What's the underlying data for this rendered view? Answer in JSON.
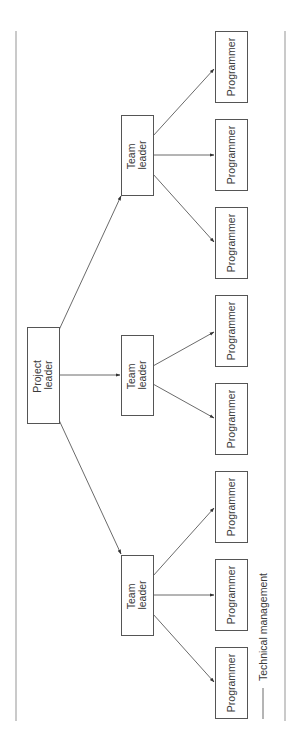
{
  "diagram": {
    "type": "org-chart",
    "orientation": "rotated-90",
    "nodes": {
      "project_leader": {
        "line1": "Project",
        "line2": "leader"
      },
      "team_leaders": [
        {
          "line1": "Team",
          "line2": "leader"
        },
        {
          "line1": "Team",
          "line2": "leader"
        },
        {
          "line1": "Team",
          "line2": "leader"
        }
      ],
      "programmers": [
        {
          "label": "Programmer",
          "team": 1
        },
        {
          "label": "Programmer",
          "team": 1
        },
        {
          "label": "Programmer",
          "team": 1
        },
        {
          "label": "Programmer",
          "team": 2
        },
        {
          "label": "Programmer",
          "team": 2
        },
        {
          "label": "Programmer",
          "team": 3
        },
        {
          "label": "Programmer",
          "team": 3
        },
        {
          "label": "Programmer",
          "team": 3
        }
      ]
    },
    "edges": [
      {
        "from": "Project leader",
        "to": "Team leader 1"
      },
      {
        "from": "Project leader",
        "to": "Team leader 2"
      },
      {
        "from": "Project leader",
        "to": "Team leader 3"
      },
      {
        "from": "Team leader 1",
        "to": "Programmer 1"
      },
      {
        "from": "Team leader 1",
        "to": "Programmer 2"
      },
      {
        "from": "Team leader 1",
        "to": "Programmer 3"
      },
      {
        "from": "Team leader 2",
        "to": "Programmer 4"
      },
      {
        "from": "Team leader 2",
        "to": "Programmer 5"
      },
      {
        "from": "Team leader 3",
        "to": "Programmer 6"
      },
      {
        "from": "Team leader 3",
        "to": "Programmer 7"
      },
      {
        "from": "Team leader 3",
        "to": "Programmer 8"
      }
    ],
    "legend": {
      "label": "Technical management"
    }
  }
}
